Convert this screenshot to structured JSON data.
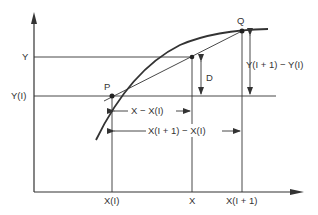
{
  "diagram": {
    "type": "linear-interpolation",
    "colors": {
      "line": "#333333",
      "background": "#ffffff"
    },
    "points": {
      "P": {
        "label": "P"
      },
      "Q": {
        "label": "Q"
      }
    },
    "y_axis_labels": {
      "y": "Y",
      "y_i": "Y(I)"
    },
    "x_axis_labels": {
      "x_i": "X(I)",
      "x": "X",
      "x_i1": "X(I + 1)"
    },
    "dimensions": {
      "d": "D",
      "x_minus_xi": "X − X(I)",
      "xi1_minus_xi": "X(I + 1) − X(I)",
      "yi1_minus_yi": "Y(I + 1) − Y(I)"
    }
  }
}
